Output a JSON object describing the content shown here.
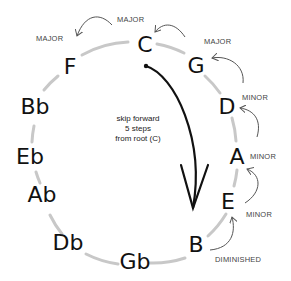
{
  "diagram": {
    "notes": [
      {
        "name": "C",
        "x": 145,
        "y": 52
      },
      {
        "name": "G",
        "x": 196,
        "y": 73
      },
      {
        "name": "D",
        "x": 227,
        "y": 114
      },
      {
        "name": "A",
        "x": 237,
        "y": 164
      },
      {
        "name": "E",
        "x": 228,
        "y": 209
      },
      {
        "name": "B",
        "x": 196,
        "y": 252
      },
      {
        "name": "Gb",
        "x": 135,
        "y": 269
      },
      {
        "name": "Db",
        "x": 68,
        "y": 250
      },
      {
        "name": "Ab",
        "x": 42,
        "y": 202
      },
      {
        "name": "Eb",
        "x": 30,
        "y": 164
      },
      {
        "name": "Bb",
        "x": 35,
        "y": 114
      },
      {
        "name": "F",
        "x": 70,
        "y": 74
      }
    ],
    "qualities": [
      {
        "label": "MAJOR",
        "x": 130,
        "y": 22
      },
      {
        "label": "MAJOR",
        "x": 36,
        "y": 41
      },
      {
        "label": "MAJOR",
        "x": 204,
        "y": 44
      },
      {
        "label": "MINOR",
        "x": 242,
        "y": 100
      },
      {
        "label": "MINOR",
        "x": 250,
        "y": 159
      },
      {
        "label": "MINOR",
        "x": 246,
        "y": 217
      },
      {
        "label": "DIMINISHED",
        "x": 215,
        "y": 262
      }
    ],
    "center_text": [
      "skip forward",
      "5 steps",
      "from root (C)"
    ],
    "colors": {
      "circle": "#c8c8c8",
      "arrows": "#555555",
      "main_arrow": "#111111",
      "text": "#111111"
    }
  }
}
